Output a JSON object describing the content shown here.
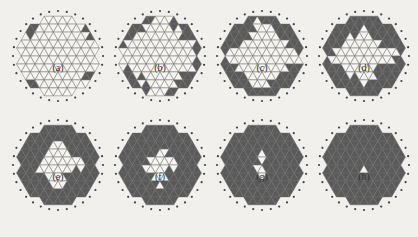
{
  "figure": {
    "top_cut_text": "",
    "colors": {
      "background": "#f1f0ec",
      "mesh_line": "#6e6e6e",
      "filled": "#5a5a5a",
      "node": "#444444",
      "void": "#f6f5f1"
    },
    "panels": [
      {
        "id": "a",
        "label": "(a)",
        "cx": 58,
        "cy": 56,
        "fill_level": 0.0
      },
      {
        "id": "b",
        "label": "(b)",
        "cx": 160,
        "cy": 56,
        "fill_level": 0.12
      },
      {
        "id": "c",
        "label": "(c)",
        "cx": 262,
        "cy": 56,
        "fill_level": 0.22
      },
      {
        "id": "d",
        "label": "(d)",
        "cx": 364,
        "cy": 56,
        "fill_level": 0.32
      },
      {
        "id": "e",
        "label": "(e)",
        "cx": 58,
        "cy": 165,
        "fill_level": 0.45
      },
      {
        "id": "f",
        "label": "(f)",
        "cx": 160,
        "cy": 165,
        "fill_level": 0.55
      },
      {
        "id": "g",
        "label": "(g)",
        "cx": 262,
        "cy": 165,
        "fill_level": 0.7
      },
      {
        "id": "h",
        "label": "(h)",
        "cx": 364,
        "cy": 165,
        "fill_level": 0.88
      }
    ],
    "radius": 45,
    "label_offset_y": 54
  }
}
